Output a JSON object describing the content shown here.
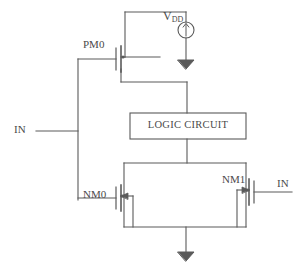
{
  "figure": {
    "type": "circuit-schematic",
    "background_color": "#ffffff",
    "line_color": "#5a5a5a"
  },
  "labels": {
    "pmos_name": "PM0",
    "nmos0_name": "NM0",
    "nmos1_name": "NM1",
    "input_left": "IN",
    "input_right": "IN",
    "supply_main": "V",
    "supply_sub": "DD",
    "logic_block": "LOGIC CIRCUIT"
  },
  "components": [
    {
      "id": "PM0",
      "type": "pmos-transistor",
      "label": "PM0"
    },
    {
      "id": "NM0",
      "type": "nmos-transistor",
      "label": "NM0"
    },
    {
      "id": "NM1",
      "type": "nmos-transistor",
      "label": "NM1"
    },
    {
      "id": "VDD",
      "type": "voltage-source",
      "label": "VDD"
    },
    {
      "id": "LOGIC",
      "type": "block",
      "label": "LOGIC CIRCUIT"
    },
    {
      "id": "GND1",
      "type": "ground",
      "label": ""
    },
    {
      "id": "GND2",
      "type": "ground",
      "label": ""
    }
  ],
  "nets": [
    {
      "name": "IN",
      "connects": [
        "PM0.gate",
        "NM0.gate"
      ]
    },
    {
      "name": "IN",
      "connects": [
        "NM1.gate"
      ]
    },
    {
      "name": "VDD",
      "connects": [
        "VDD.plus",
        "PM0.source"
      ]
    },
    {
      "name": "OUT",
      "connects": [
        "PM0.drain",
        "LOGIC.in"
      ]
    },
    {
      "name": "PULLDOWN",
      "connects": [
        "LOGIC.out",
        "NM0.drain",
        "NM1.drain"
      ]
    },
    {
      "name": "GND",
      "connects": [
        "NM0.source",
        "NM1.source",
        "GND2"
      ]
    }
  ]
}
